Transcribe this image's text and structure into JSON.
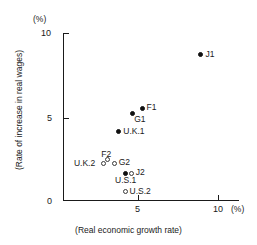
{
  "chart_data": {
    "type": "scatter",
    "title": "",
    "xlabel": "(Real economic growth rate)",
    "ylabel": "(Rate of increase in real wages)",
    "x_unit": "(%)",
    "y_unit": "(%)",
    "xlim": [
      0,
      11
    ],
    "ylim": [
      0,
      10.4
    ],
    "xticks": [
      5,
      10
    ],
    "yticks": [
      0,
      5,
      10
    ],
    "xtick_labels": [
      "5",
      "10"
    ],
    "ytick_labels": [
      "0",
      "5",
      "10"
    ],
    "grid": false,
    "legend": "none",
    "points": [
      {
        "label": "J1",
        "x": 8.9,
        "y": 8.7,
        "marker": "filled",
        "label_pos": "right"
      },
      {
        "label": "F1",
        "x": 5.1,
        "y": 5.5,
        "marker": "filled",
        "label_pos": "right"
      },
      {
        "label": "G1",
        "x": 4.5,
        "y": 5.2,
        "marker": "filled",
        "label_pos": "below-right"
      },
      {
        "label": "U.K.1",
        "x": 3.6,
        "y": 4.1,
        "marker": "filled",
        "label_pos": "right"
      },
      {
        "label": "F2",
        "x": 2.6,
        "y": 2.2,
        "marker": "open",
        "label_pos": "above"
      },
      {
        "label": "G2",
        "x": 3.3,
        "y": 2.2,
        "marker": "open",
        "label_pos": "right"
      },
      {
        "label": "U.K.2",
        "x": 2.9,
        "y": 2.4,
        "marker": "open",
        "label_pos": "below-left"
      },
      {
        "label": "U.S.1",
        "x": 4.0,
        "y": 1.6,
        "marker": "filled",
        "label_pos": "below"
      },
      {
        "label": "J2",
        "x": 4.4,
        "y": 1.6,
        "marker": "open",
        "label_pos": "right"
      },
      {
        "label": "U.S.2",
        "x": 4.0,
        "y": 0.5,
        "marker": "open",
        "label_pos": "right"
      }
    ]
  }
}
